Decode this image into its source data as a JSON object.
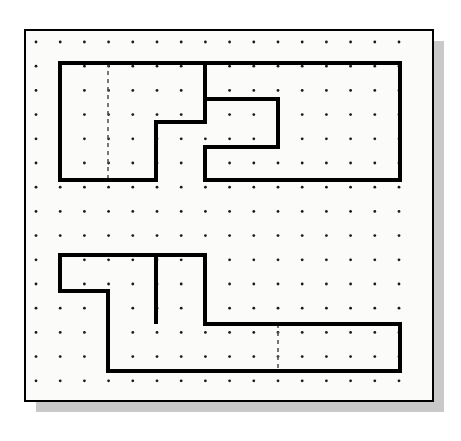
{
  "document": {
    "title": "Orthographic Views on Dot Grid",
    "kind": "engineering-sketch",
    "canvas": {
      "width": 461,
      "height": 441
    }
  },
  "colors": {
    "page_background": "#ffffff",
    "sheet_fill": "#fbfbf9",
    "sheet_border": "#000000",
    "shadow": "#c9c9c9",
    "outline": "#000000",
    "grid_dot": "#1a1a1a",
    "hidden_line": "#555555"
  },
  "sheet": {
    "x": 25,
    "y": 30,
    "width": 408,
    "height": 371,
    "border_width": 2,
    "shadow_offset_x": 11,
    "shadow_offset_y": 11
  },
  "grid": {
    "origin_x": 36,
    "origin_y": 42,
    "spacing": 24.2,
    "columns": 16,
    "rows": 15,
    "dot_radius": 1.4,
    "label": "square dot grid"
  },
  "chart_data": {
    "type": "diagram",
    "views": [
      {
        "name": "top-view",
        "label": "Upper view (plan)",
        "outline_kind": "closed-polyline",
        "stroke_width": 4,
        "points": [
          [
            60,
            63
          ],
          [
            205,
            63
          ],
          [
            205,
            122
          ],
          [
            156,
            122
          ],
          [
            156,
            180
          ],
          [
            60,
            180
          ]
        ],
        "note": "L-shaped left profile with step notch"
      },
      {
        "name": "top-view-right",
        "label": "Upper view right member (C-channel)",
        "outline_kind": "closed-polyline",
        "stroke_width": 4,
        "points": [
          [
            205,
            63
          ],
          [
            400,
            63
          ],
          [
            400,
            180
          ],
          [
            205,
            180
          ],
          [
            205,
            147
          ],
          [
            278,
            147
          ],
          [
            278,
            99
          ],
          [
            205,
            99
          ]
        ],
        "note": "C shaped slot opening to the left"
      },
      {
        "name": "bottom-view",
        "label": "Lower view (front elevation)",
        "outline_kind": "closed-polyline",
        "stroke_width": 4,
        "points": [
          [
            60,
            255
          ],
          [
            205,
            255
          ],
          [
            205,
            324
          ],
          [
            400,
            324
          ],
          [
            400,
            371
          ],
          [
            108,
            371
          ],
          [
            108,
            291
          ],
          [
            60,
            291
          ]
        ],
        "note": "Stepped Z profile with raised central tab"
      },
      {
        "name": "bottom-view-tab",
        "label": "Lower view inner tab",
        "outline_kind": "open-polyline",
        "stroke_width": 4,
        "points": [
          [
            156,
            255
          ],
          [
            156,
            324
          ]
        ],
        "note": "Vertical division line of the raised tab"
      }
    ],
    "hidden_lines": [
      {
        "name": "top-view-hidden-center",
        "label": "Hidden edge in upper view",
        "x1": 108,
        "y1": 63,
        "x2": 108,
        "y2": 180,
        "dash": "4 4"
      },
      {
        "name": "bottom-view-hidden-center",
        "label": "Hidden edge in lower view",
        "x1": 278,
        "y1": 324,
        "x2": 278,
        "y2": 371,
        "dash": "4 4"
      }
    ]
  }
}
